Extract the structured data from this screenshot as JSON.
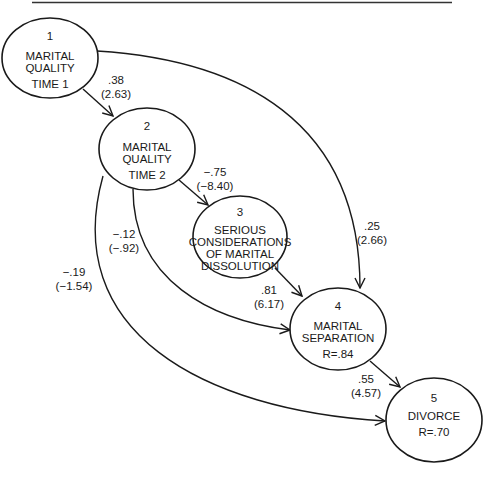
{
  "diagram": {
    "type": "path-analysis",
    "colors": {
      "line": "#1a1a1a",
      "background": "#ffffff"
    },
    "nodes": [
      {
        "id": "1",
        "number": "1",
        "lines": [
          "MARITAL",
          "QUALITY",
          "TIME 1"
        ]
      },
      {
        "id": "2",
        "number": "2",
        "lines": [
          "MARITAL",
          "QUALITY",
          "TIME 2"
        ]
      },
      {
        "id": "3",
        "number": "3",
        "lines": [
          "SERIOUS",
          "CONSIDERATIONS",
          "OF MARITAL",
          "DISSOLUTION"
        ]
      },
      {
        "id": "4",
        "number": "4",
        "lines": [
          "MARITAL",
          "SEPARATION",
          "R=.84"
        ]
      },
      {
        "id": "5",
        "number": "5",
        "lines": [
          "DIVORCE",
          "R=.70"
        ]
      }
    ],
    "edges": [
      {
        "from": "1",
        "to": "2",
        "coefficient": ".38",
        "t_value": "(2.63)"
      },
      {
        "from": "2",
        "to": "3",
        "coefficient": "−.75",
        "t_value": "(−8.40)"
      },
      {
        "from": "1",
        "to": "4",
        "coefficient": ".25",
        "t_value": "(2.66)"
      },
      {
        "from": "2",
        "to": "4",
        "coefficient": "−.12",
        "t_value": "(−.92)"
      },
      {
        "from": "3",
        "to": "4",
        "coefficient": ".81",
        "t_value": "(6.17)"
      },
      {
        "from": "2",
        "to": "5",
        "coefficient": "−.19",
        "t_value": "(−1.54)"
      },
      {
        "from": "4",
        "to": "5",
        "coefficient": ".55",
        "t_value": "(4.57)"
      }
    ]
  }
}
